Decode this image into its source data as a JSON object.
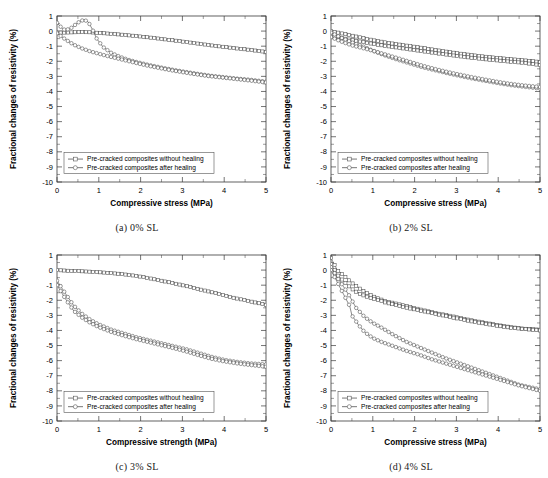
{
  "figure": {
    "panel_count": 4,
    "series_names": [
      "Pre-cracked composites without healing",
      "Pre-cracked composites after healing"
    ],
    "marker_without": "square",
    "marker_after": "circle",
    "line_color": "#4a4a4a",
    "frame_color": "#3a3a3a"
  },
  "panels": [
    {
      "caption": "(a) 0% SL",
      "legend": [
        "Pre-cracked composites without healing",
        "Pre-cracked composites after healing"
      ],
      "chart_data": {
        "type": "line",
        "title": "",
        "xlabel": "Compressive stress (MPa)",
        "ylabel": "Fractional changes of resistivity (%)",
        "xlim": [
          0,
          5
        ],
        "ylim": [
          -10,
          1
        ],
        "xticks": [
          0,
          1,
          2,
          3,
          4,
          5
        ],
        "yticks": [
          1,
          0,
          -1,
          -2,
          -3,
          -4,
          -5,
          -6,
          -7,
          -8,
          -9,
          -10
        ],
        "xminor_step": 0.5,
        "yminor_step": 0.5,
        "grid": false,
        "legend_position": "lower-left",
        "series": [
          {
            "name": "Pre-cracked composites without healing",
            "marker": "square",
            "x": [
              0,
              0.2,
              0.4,
              0.6,
              0.8,
              1.0,
              1.3,
              1.6,
              1.9,
              2.2,
              2.5,
              2.8,
              3.1,
              3.4,
              3.7,
              4.0,
              4.3,
              4.6,
              5.0
            ],
            "y": [
              -0.1,
              -0.1,
              -0.08,
              -0.07,
              -0.08,
              -0.12,
              -0.18,
              -0.25,
              -0.33,
              -0.42,
              -0.52,
              -0.62,
              -0.73,
              -0.84,
              -0.95,
              -1.05,
              -1.15,
              -1.24,
              -1.38
            ]
          },
          {
            "name": "Pre-cracked composites after healing",
            "marker": "circle",
            "x": [
              0,
              0.15,
              0.3,
              0.45,
              0.55,
              0.65,
              0.75,
              0.85,
              0.95,
              1.1,
              1.3,
              1.5,
              1.7,
              1.9,
              2.2,
              2.5,
              2.8,
              3.1,
              3.4,
              3.7,
              4.0,
              4.3,
              4.6,
              5.0
            ],
            "y": [
              0.55,
              0.1,
              0.12,
              0.45,
              0.65,
              0.75,
              0.6,
              0.1,
              -0.5,
              -1.05,
              -1.45,
              -1.7,
              -1.9,
              -2.05,
              -2.25,
              -2.42,
              -2.58,
              -2.72,
              -2.85,
              -2.97,
              -3.06,
              -3.15,
              -3.22,
              -3.35
            ]
          },
          {
            "name": "Pre-cracked composites after healing lower branch",
            "marker": "circle",
            "x": [
              0,
              0.2,
              0.4,
              0.6,
              0.8,
              1.0,
              1.2,
              1.5,
              1.8,
              2.1,
              2.4,
              2.7,
              3.0,
              3.3,
              3.6,
              3.9,
              4.2,
              4.5,
              5.0
            ],
            "y": [
              -0.15,
              -0.55,
              -0.9,
              -1.15,
              -1.35,
              -1.5,
              -1.65,
              -1.85,
              -2.05,
              -2.25,
              -2.42,
              -2.58,
              -2.72,
              -2.85,
              -2.97,
              -3.06,
              -3.15,
              -3.24,
              -3.4
            ]
          }
        ]
      }
    },
    {
      "caption": "(b) 2% SL",
      "legend": [
        "Pre-cracked composites without healing",
        "Pre-cracked composites after healing"
      ],
      "chart_data": {
        "type": "line",
        "title": "",
        "xlabel": "Compressive stress (MPa)",
        "ylabel": "Fractional changes of resistivity (%)",
        "xlim": [
          0,
          5
        ],
        "ylim": [
          -10,
          1
        ],
        "xticks": [
          0,
          1,
          2,
          3,
          4,
          5
        ],
        "yticks": [
          1,
          0,
          -1,
          -2,
          -3,
          -4,
          -5,
          -6,
          -7,
          -8,
          -9,
          -10
        ],
        "xminor_step": 0.5,
        "yminor_step": 0.5,
        "grid": false,
        "legend_position": "lower-left",
        "series": [
          {
            "name": "Pre-cracked composites without healing",
            "marker": "square",
            "x": [
              0,
              0.25,
              0.5,
              0.75,
              1.0,
              1.3,
              1.6,
              1.9,
              2.2,
              2.5,
              2.8,
              3.1,
              3.4,
              3.7,
              4.0,
              4.3,
              4.6,
              5.0
            ],
            "y": [
              0.0,
              -0.15,
              -0.3,
              -0.45,
              -0.6,
              -0.75,
              -0.88,
              -1.0,
              -1.12,
              -1.25,
              -1.38,
              -1.5,
              -1.6,
              -1.7,
              -1.78,
              -1.86,
              -1.93,
              -2.05
            ]
          },
          {
            "name": "Pre-cracked composites without healing second branch",
            "marker": "square",
            "x": [
              0,
              0.25,
              0.5,
              0.75,
              1.0,
              1.3,
              1.6,
              1.9,
              2.2,
              2.5,
              2.8,
              3.1,
              3.4,
              3.7,
              4.0,
              4.3,
              4.6,
              5.0
            ],
            "y": [
              -0.3,
              -0.45,
              -0.6,
              -0.72,
              -0.85,
              -0.98,
              -1.1,
              -1.22,
              -1.34,
              -1.46,
              -1.57,
              -1.68,
              -1.78,
              -1.87,
              -1.95,
              -2.03,
              -2.1,
              -2.25
            ]
          },
          {
            "name": "Pre-cracked composites after healing",
            "marker": "circle",
            "x": [
              0,
              0.25,
              0.5,
              0.75,
              1.0,
              1.3,
              1.6,
              1.9,
              2.2,
              2.5,
              2.8,
              3.1,
              3.4,
              3.7,
              4.0,
              4.3,
              4.6,
              5.0
            ],
            "y": [
              -0.1,
              -0.45,
              -0.75,
              -1.0,
              -1.3,
              -1.62,
              -1.9,
              -2.15,
              -2.4,
              -2.6,
              -2.8,
              -2.98,
              -3.15,
              -3.3,
              -3.45,
              -3.58,
              -3.68,
              -3.8
            ]
          },
          {
            "name": "Pre-cracked composites after healing upper branch",
            "marker": "circle",
            "x": [
              0,
              0.25,
              0.5,
              0.75,
              1.0,
              1.3,
              1.6,
              1.9,
              2.2,
              2.5,
              2.8,
              3.1,
              3.4,
              3.7,
              4.0,
              4.3,
              4.6,
              5.0
            ],
            "y": [
              -0.4,
              -0.7,
              -0.95,
              -1.12,
              -1.3,
              -1.55,
              -1.8,
              -2.05,
              -2.3,
              -2.52,
              -2.72,
              -2.9,
              -3.07,
              -3.22,
              -3.37,
              -3.5,
              -3.6,
              -3.7
            ]
          }
        ]
      }
    },
    {
      "caption": "(c) 3% SL",
      "legend": [
        "Pre-cracked composites without healing",
        "Pre-cracked composites after healing"
      ],
      "chart_data": {
        "type": "line",
        "title": "",
        "xlabel": "Compressive strength (MPa)",
        "ylabel": "Fractional changes of resistivity (%)",
        "xlim": [
          0,
          5
        ],
        "ylim": [
          -10,
          1
        ],
        "xticks": [
          0,
          1,
          2,
          3,
          4,
          5
        ],
        "yticks": [
          1,
          0,
          -1,
          -2,
          -3,
          -4,
          -5,
          -6,
          -7,
          -8,
          -9,
          -10
        ],
        "xminor_step": 0.5,
        "yminor_step": 0.5,
        "grid": false,
        "legend_position": "lower-left",
        "series": [
          {
            "name": "Pre-cracked composites without healing",
            "marker": "square",
            "x": [
              0,
              0.3,
              0.6,
              0.9,
              1.2,
              1.5,
              1.8,
              2.1,
              2.4,
              2.7,
              3.0,
              3.3,
              3.6,
              3.9,
              4.2,
              4.5,
              4.8,
              5.0
            ],
            "y": [
              0.0,
              -0.05,
              -0.08,
              -0.12,
              -0.18,
              -0.25,
              -0.35,
              -0.48,
              -0.65,
              -0.82,
              -1.0,
              -1.2,
              -1.4,
              -1.6,
              -1.82,
              -2.0,
              -2.18,
              -2.3
            ]
          },
          {
            "name": "Pre-cracked composites after healing",
            "marker": "circle",
            "x": [
              0,
              0.2,
              0.4,
              0.6,
              0.8,
              1.0,
              1.3,
              1.6,
              1.9,
              2.2,
              2.5,
              2.8,
              3.1,
              3.4,
              3.7,
              4.0,
              4.3,
              4.6,
              5.0
            ],
            "y": [
              -0.7,
              -1.55,
              -2.35,
              -2.9,
              -3.3,
              -3.6,
              -3.95,
              -4.2,
              -4.45,
              -4.65,
              -4.85,
              -5.05,
              -5.25,
              -5.5,
              -5.75,
              -5.95,
              -6.08,
              -6.18,
              -6.25
            ]
          },
          {
            "name": "Pre-cracked composites after healing lower branch",
            "marker": "circle",
            "x": [
              0,
              0.2,
              0.4,
              0.6,
              0.8,
              1.0,
              1.3,
              1.6,
              1.9,
              2.2,
              2.5,
              2.8,
              3.1,
              3.4,
              3.7,
              4.0,
              4.3,
              4.6,
              5.0
            ],
            "y": [
              -1.0,
              -1.9,
              -2.7,
              -3.15,
              -3.5,
              -3.78,
              -4.1,
              -4.35,
              -4.58,
              -4.78,
              -4.98,
              -5.18,
              -5.4,
              -5.65,
              -5.88,
              -6.05,
              -6.18,
              -6.28,
              -6.4
            ]
          }
        ]
      }
    },
    {
      "caption": "(d) 4% SL",
      "legend": [
        "Pre-cracked composites without healing",
        "Pre-cracked composites after healing"
      ],
      "chart_data": {
        "type": "line",
        "title": "",
        "xlabel": "Compressive stress (MPa)",
        "ylabel": "Fractional changes of resistivity (%)",
        "xlim": [
          0,
          5
        ],
        "ylim": [
          -10,
          1
        ],
        "xticks": [
          0,
          1,
          2,
          3,
          4,
          5
        ],
        "yticks": [
          1,
          0,
          -1,
          -2,
          -3,
          -4,
          -5,
          -6,
          -7,
          -8,
          -9,
          -10
        ],
        "xminor_step": 0.5,
        "yminor_step": 0.5,
        "grid": false,
        "legend_position": "lower-left",
        "series": [
          {
            "name": "Pre-cracked composites without healing",
            "marker": "square",
            "x": [
              0,
              0.15,
              0.3,
              0.5,
              0.7,
              0.9,
              1.1,
              1.3,
              1.6,
              1.9,
              2.2,
              2.5,
              2.8,
              3.1,
              3.4,
              3.7,
              4.0,
              4.3,
              4.6,
              5.0
            ],
            "y": [
              0.8,
              0.0,
              -0.35,
              -0.85,
              -1.25,
              -1.6,
              -1.85,
              -2.05,
              -2.25,
              -2.45,
              -2.65,
              -2.85,
              -3.0,
              -3.18,
              -3.35,
              -3.5,
              -3.65,
              -3.78,
              -3.88,
              -3.95
            ]
          },
          {
            "name": "Pre-cracked composites without healing second branch",
            "marker": "square",
            "x": [
              0,
              0.15,
              0.3,
              0.5,
              0.7,
              0.9,
              1.1,
              1.3,
              1.6,
              1.9,
              2.2,
              2.5,
              2.8,
              3.1,
              3.4,
              3.7,
              4.0,
              4.3,
              4.6,
              5.0
            ],
            "y": [
              0.4,
              -0.3,
              -0.75,
              -1.25,
              -1.6,
              -1.8,
              -1.95,
              -2.15,
              -2.35,
              -2.55,
              -2.72,
              -2.9,
              -3.08,
              -3.25,
              -3.42,
              -3.56,
              -3.7,
              -3.82,
              -3.9,
              -4.0
            ]
          },
          {
            "name": "Pre-cracked composites after healing",
            "marker": "circle",
            "x": [
              0,
              0.15,
              0.3,
              0.45,
              0.6,
              0.8,
              1.0,
              1.2,
              1.5,
              1.8,
              2.1,
              2.4,
              2.7,
              3.0,
              3.3,
              3.6,
              3.9,
              4.2,
              4.5,
              5.0
            ],
            "y": [
              0.2,
              -0.5,
              -1.1,
              -1.75,
              -2.5,
              -3.1,
              -3.5,
              -3.8,
              -4.3,
              -4.75,
              -5.1,
              -5.45,
              -5.8,
              -6.1,
              -6.4,
              -6.7,
              -7.0,
              -7.3,
              -7.6,
              -7.9
            ]
          },
          {
            "name": "Pre-cracked composites after healing steep branch",
            "marker": "circle",
            "x": [
              0,
              0.15,
              0.3,
              0.45,
              0.5,
              0.65,
              0.8,
              1.0,
              1.2,
              1.5,
              1.8,
              2.1,
              2.4,
              2.7,
              3.0,
              3.3,
              3.6,
              3.9,
              4.2,
              4.5,
              5.0
            ],
            "y": [
              0.0,
              -0.8,
              -1.6,
              -2.4,
              -3.0,
              -3.6,
              -4.1,
              -4.5,
              -4.75,
              -5.05,
              -5.35,
              -5.6,
              -5.9,
              -6.15,
              -6.4,
              -6.65,
              -6.9,
              -7.15,
              -7.4,
              -7.65,
              -8.0
            ]
          }
        ]
      }
    }
  ]
}
